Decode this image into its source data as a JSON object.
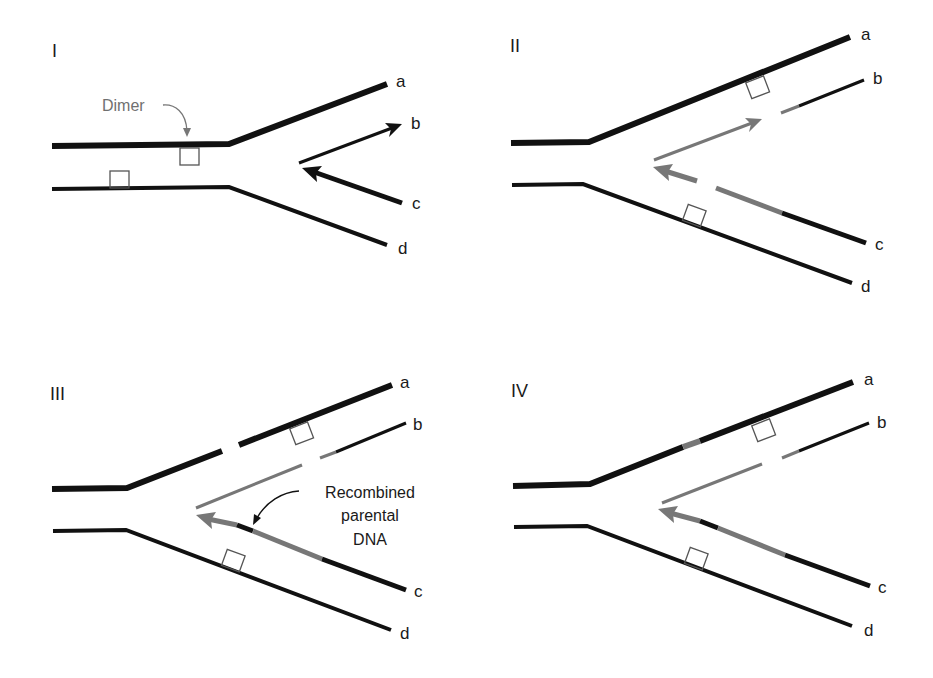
{
  "figure": {
    "title": "",
    "colors": {
      "parental": "#111111",
      "new_strand": "#757575",
      "dimer": "#555555",
      "annotation_gray": "#707070"
    },
    "annotations": {
      "dimer": "Dimer",
      "recombined_line1": "Recombined",
      "recombined_line2": "parental",
      "recombined_line3": "DNA"
    },
    "panels": [
      {
        "id": "I",
        "label": "I",
        "strands": [
          "a",
          "b",
          "c",
          "d"
        ]
      },
      {
        "id": "II",
        "label": "II",
        "strands": [
          "a",
          "b",
          "c",
          "d"
        ]
      },
      {
        "id": "III",
        "label": "III",
        "strands": [
          "a",
          "b",
          "c",
          "d"
        ]
      },
      {
        "id": "IV",
        "label": "IV",
        "strands": [
          "a",
          "b",
          "c",
          "d"
        ]
      }
    ]
  }
}
